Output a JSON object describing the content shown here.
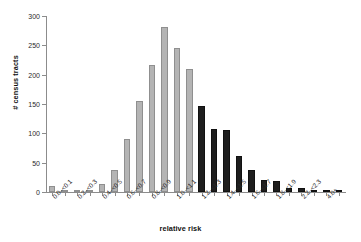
{
  "chart_data": {
    "type": "bar",
    "title": "",
    "xlabel": "relative risk",
    "ylabel": "# census tracts",
    "ylim": [
      0,
      300
    ],
    "yticks": [
      0,
      50,
      100,
      150,
      200,
      250,
      300
    ],
    "grid": false,
    "legend": false,
    "categories": [
      "0.0–<0.1",
      "0.1–<0.2",
      "0.2–<0.3",
      "0.3–<0.4",
      "0.4–<0.5",
      "0.5–<0.6",
      "0.6–<0.7",
      "0.7–<0.8",
      "0.8–<0.9",
      "0.9–<1.0",
      "1.0–<1.1",
      "1.1–<1.2",
      "1.2–<1.3",
      "1.3–<1.4",
      "1.4–<1.5",
      "1.5–<1.6",
      "1.6–<1.7",
      "1.7–<1.8",
      "1.8–<1.9",
      "1.9–<2.0",
      "2.2–<2.3",
      "2.3–<2.4",
      "4.0+",
      "4.1+"
    ],
    "tick_labels_visible": [
      "0.0–<0.1",
      "",
      "0.2–<0.3",
      "",
      "0.4–<0.5",
      "",
      "0.6–<0.7",
      "",
      "0.8–<0.9",
      "",
      "1.0–<1.1",
      "",
      "1.2–<1.3",
      "",
      "1.4–<1.5",
      "",
      "1.6–<1.7",
      "",
      "1.8–<1.9",
      "",
      "2.2–<2.3",
      "",
      "4.0+",
      ""
    ],
    "values": [
      10,
      3,
      3,
      3,
      14,
      38,
      91,
      155,
      216,
      281,
      246,
      209,
      146,
      108,
      106,
      62,
      37,
      20,
      18,
      7,
      6,
      3,
      3,
      2
    ],
    "bar_colors": [
      "light",
      "light",
      "light",
      "light",
      "light",
      "light",
      "light",
      "light",
      "light",
      "light",
      "light",
      "light",
      "dark",
      "dark",
      "dark",
      "dark",
      "dark",
      "dark",
      "dark",
      "dark",
      "dark",
      "dark",
      "dark",
      "dark"
    ],
    "colors": {
      "light_bar": "#b4b4b4",
      "light_bar_edge": "#8f8f8f",
      "dark_bar": "#1e1e1e",
      "axis": "#8c8c8c",
      "text": "#1a1a1a",
      "background": "#ffffff"
    }
  }
}
